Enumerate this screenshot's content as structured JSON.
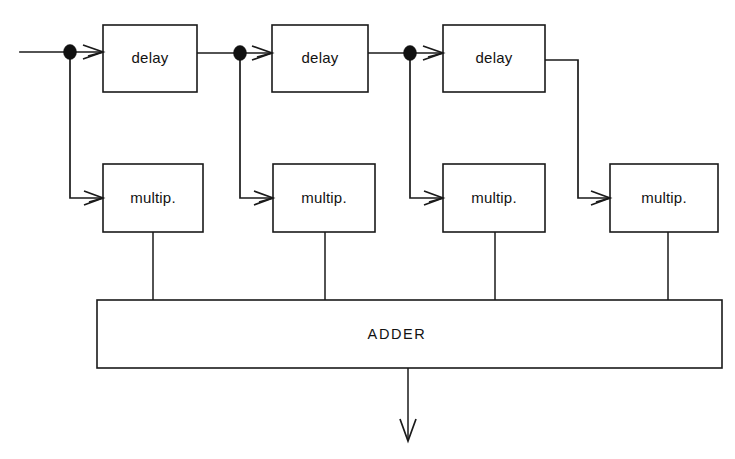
{
  "figure": {
    "background_color": "#ffffff",
    "line_color": "#1a1a1a",
    "text_color": "#121212"
  },
  "blocks": {
    "delays": [
      {
        "label": "delay",
        "x": 103,
        "y": 25,
        "w": 94,
        "h": 67
      },
      {
        "label": "delay",
        "x": 272,
        "y": 25,
        "w": 96,
        "h": 67
      },
      {
        "label": "delay",
        "x": 443,
        "y": 25,
        "w": 102,
        "h": 67
      }
    ],
    "multipliers": [
      {
        "label": "multip.",
        "x": 103,
        "y": 164,
        "w": 100,
        "h": 68
      },
      {
        "label": "multip.",
        "x": 273,
        "y": 164,
        "w": 102,
        "h": 68
      },
      {
        "label": "multip.",
        "x": 443,
        "y": 164,
        "w": 102,
        "h": 68
      },
      {
        "label": "multip.",
        "x": 610,
        "y": 164,
        "w": 108,
        "h": 68
      }
    ],
    "adder": {
      "label": "ADDER",
      "x": 97,
      "y": 300,
      "w": 625,
      "h": 68
    }
  },
  "junctions": [
    {
      "name": "tap-node-0",
      "x": 70,
      "y": 52
    },
    {
      "name": "tap-node-1",
      "x": 240,
      "y": 53
    },
    {
      "name": "tap-node-2",
      "x": 410,
      "y": 53
    }
  ],
  "signals": {
    "input_label": "",
    "output_label": "",
    "input_start_x": 20,
    "signal_line_y": 52,
    "tap_feed_y": 198
  },
  "connector_x": {
    "mult_to_adder": [
      153,
      325,
      495,
      668
    ],
    "adder_output": 408
  }
}
